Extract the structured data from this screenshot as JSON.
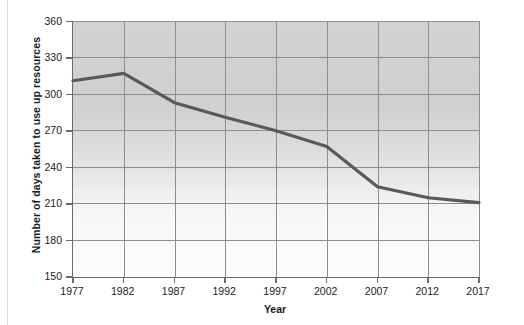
{
  "chart_data": {
    "type": "line",
    "title": "",
    "xlabel": "Year",
    "ylabel": "Number of days taken to use up resources",
    "x": [
      1977,
      1982,
      1987,
      1992,
      1997,
      2002,
      2007,
      2012,
      2017
    ],
    "categories": [
      "1977",
      "1982",
      "1987",
      "1992",
      "1997",
      "2002",
      "2007",
      "2012",
      "2017"
    ],
    "values": [
      311,
      317,
      293,
      281,
      270,
      257,
      224,
      215,
      211
    ],
    "series": [
      {
        "name": "Number of days taken to use up resources",
        "values": [
          311,
          317,
          293,
          281,
          270,
          257,
          224,
          215,
          211
        ]
      }
    ],
    "xlim": [
      1977,
      2017
    ],
    "ylim": [
      150,
      360
    ],
    "ytick_labels": [
      "150",
      "180",
      "210",
      "240",
      "270",
      "300",
      "330",
      "360"
    ],
    "yticks": [
      150,
      180,
      210,
      240,
      270,
      300,
      330,
      360
    ],
    "xtick_labels": [
      "1977",
      "1982",
      "1987",
      "1992",
      "1997",
      "2002",
      "2007",
      "2012",
      "2017"
    ],
    "grid": true,
    "legend": "none",
    "line_color": "#595959",
    "plot_background_top": "#d2d2d2",
    "plot_background_bottom": "#fdfdfd",
    "gridline_color": "#8d8d8d",
    "axis_color": "#6b6b6b",
    "text_color": "#1b1b1b"
  },
  "footer": {
    "smudge_text": ""
  }
}
